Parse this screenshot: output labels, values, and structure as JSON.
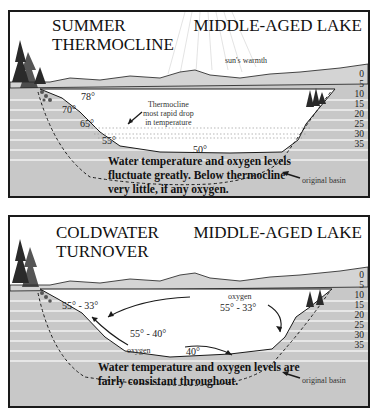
{
  "panels": [
    {
      "title_line1": "SUMMER",
      "title_line2": "THERMOCLINE",
      "lake_label": "MIDDLE-AGED LAKE",
      "sun_label": "sun's warmth",
      "thermocline_note": [
        "Thermocline",
        "most rapid drop",
        "in temperature"
      ],
      "temps": [
        "78°",
        "70°",
        "65°",
        "55°",
        "50°"
      ],
      "caption": "Water temperature and oxygen levels fluctuate greatly. Below thermocline very little, if any oxygen.",
      "basin_label": "original basin",
      "depths": [
        "0",
        "5",
        "10",
        "15",
        "20",
        "25",
        "30",
        "35"
      ]
    },
    {
      "title_line1": "COLDWATER",
      "title_line2": "TURNOVER",
      "lake_label": "MIDDLE-AGED LAKE",
      "oxygen_labels": [
        "oxygen",
        "oxygen"
      ],
      "temps": [
        "55° - 33°",
        "55° - 33°",
        "55° - 40°",
        "40°"
      ],
      "caption": "Water temperature and oxygen levels are fairly consistant throughout.",
      "basin_label": "original basin",
      "depths": [
        "0",
        "5",
        "10",
        "15",
        "20",
        "25",
        "30",
        "35"
      ]
    }
  ],
  "colors": {
    "ground": "#c8c8c8",
    "band_line": "#f2f2f2",
    "water": "#ffffff",
    "ink": "#1a1a1a"
  }
}
